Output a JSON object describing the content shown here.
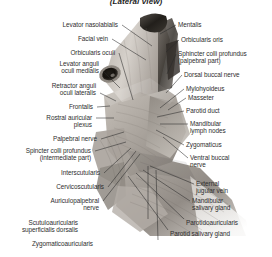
{
  "figure": {
    "title": "(Lateral view)",
    "style": "grayscale-anatomical-photograph",
    "colors": {
      "background": "#ffffff",
      "text": "#2e2e2e",
      "leader_line": "#2a2a2a",
      "tissue_light": "#cfcac4",
      "tissue_mid": "#a49e98",
      "tissue_dark": "#6e6862",
      "nose_dark": "#2a2622",
      "eye_dark": "#17140f"
    }
  },
  "labels_left": [
    {
      "text": "Levator nasolabialis",
      "x": 118,
      "y": 21,
      "lx": 122,
      "ly": 25,
      "tx": 152,
      "ty": 46
    },
    {
      "text": "Facial vein",
      "x": 108,
      "y": 35,
      "lx": 112,
      "ly": 39,
      "tx": 146,
      "ty": 60
    },
    {
      "text": "Orbicularis oculi",
      "x": 115,
      "y": 49,
      "lx": 119,
      "ly": 53,
      "tx": 133,
      "ty": 100
    },
    {
      "text": "Levator anguli\noculi medialis",
      "x": 99,
      "y": 60,
      "lx": 103,
      "ly": 71,
      "tx": 120,
      "ty": 88
    },
    {
      "text": "Retractor anguli\noculi lateralis",
      "x": 96,
      "y": 82,
      "lx": 100,
      "ly": 93,
      "tx": 116,
      "ty": 101
    },
    {
      "text": "Frontalis",
      "x": 93,
      "y": 103,
      "lx": 97,
      "ly": 107,
      "tx": 110,
      "ty": 106
    },
    {
      "text": "Rostral auricular\nplexus",
      "x": 92,
      "y": 114,
      "lx": 96,
      "ly": 118,
      "tx": 114,
      "ty": 118
    },
    {
      "text": "Palpebral nerve",
      "x": 97,
      "y": 135,
      "lx": 101,
      "ly": 139,
      "tx": 124,
      "ty": 132
    },
    {
      "text": "Spincter colli profundus\n(intermediate part)",
      "x": 91,
      "y": 147,
      "lx": 95,
      "ly": 151,
      "tx": 126,
      "ty": 142
    },
    {
      "text": "Interscutularis",
      "x": 100,
      "y": 169,
      "lx": 104,
      "ly": 173,
      "tx": 131,
      "ty": 148
    },
    {
      "text": "Cervicoscutularis",
      "x": 104,
      "y": 183,
      "lx": 108,
      "ly": 187,
      "tx": 136,
      "ty": 151
    },
    {
      "text": "Auriculopalpebral\nnerve",
      "x": 99,
      "y": 197,
      "lx": 103,
      "ly": 201,
      "tx": 140,
      "ty": 154
    }
  ],
  "labels_bottom": [
    {
      "text": "Scutuloauricularis\nsuperficialis dorsalis",
      "x": 78,
      "y": 219,
      "lx": 148,
      "ly": 219,
      "tx": 148,
      "ty": 166
    },
    {
      "text": "Zygomaticoauricularis",
      "x": 93,
      "y": 240,
      "lx": 158,
      "ly": 240,
      "tx": 156,
      "ty": 170
    }
  ],
  "labels_right": [
    {
      "text": "Mentalis",
      "x": 178,
      "y": 21,
      "lx": 176,
      "ly": 25,
      "tx": 160,
      "ty": 34
    },
    {
      "text": "Orbicularis oris",
      "x": 181,
      "y": 36,
      "lx": 179,
      "ly": 40,
      "tx": 166,
      "ty": 52
    },
    {
      "text": "Sphincter colli profundus\n(palpebral part)",
      "x": 178,
      "y": 50,
      "lx": 176,
      "ly": 54,
      "tx": 167,
      "ty": 74
    },
    {
      "text": "Dorsal buccal nerve",
      "x": 184,
      "y": 71,
      "lx": 182,
      "ly": 75,
      "tx": 166,
      "ty": 93
    },
    {
      "text": "Mylohyoideus",
      "x": 186,
      "y": 85,
      "lx": 184,
      "ly": 89,
      "tx": 160,
      "ty": 108
    },
    {
      "text": "Masseter",
      "x": 188,
      "y": 94,
      "lx": 186,
      "ly": 98,
      "tx": 168,
      "ty": 110
    },
    {
      "text": "Parotid duct",
      "x": 186,
      "y": 107,
      "lx": 184,
      "ly": 111,
      "tx": 157,
      "ty": 117
    },
    {
      "text": "Mandibular\nlymph nodes",
      "x": 190,
      "y": 120,
      "lx": 188,
      "ly": 124,
      "tx": 160,
      "ty": 124
    },
    {
      "text": "Zygomaticus",
      "x": 186,
      "y": 141,
      "lx": 184,
      "ly": 145,
      "tx": 156,
      "ty": 130
    },
    {
      "text": "Ventral buccal\nnerve",
      "x": 190,
      "y": 154,
      "lx": 188,
      "ly": 158,
      "tx": 163,
      "ty": 137
    },
    {
      "text": "External\njugular vein",
      "x": 196,
      "y": 180,
      "lx": 194,
      "ly": 184,
      "tx": 150,
      "ty": 166
    },
    {
      "text": "Mandibular\nsalivary gland",
      "x": 192,
      "y": 197,
      "lx": 190,
      "ly": 201,
      "tx": 143,
      "ty": 170
    },
    {
      "text": "Parotidoauricularis",
      "x": 186,
      "y": 219,
      "lx": 184,
      "ly": 219,
      "tx": 136,
      "ty": 173
    },
    {
      "text": "Parotid salivary gland",
      "x": 170,
      "y": 230,
      "lx": 168,
      "ly": 230,
      "tx": 128,
      "ty": 176
    }
  ]
}
